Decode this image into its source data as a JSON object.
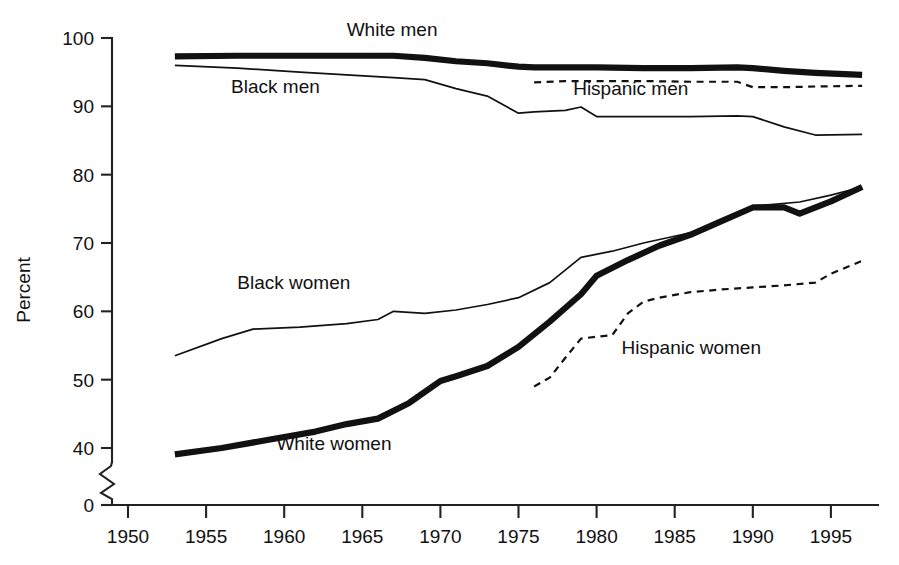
{
  "chart_data": {
    "type": "line",
    "title": "",
    "subtitle": "",
    "xlabel": "",
    "ylabel": "Percent",
    "xlim": [
      1948,
      1998.5
    ],
    "ylim": [
      0,
      100
    ],
    "y_axis_break": {
      "present": true,
      "from": 0,
      "to": 30,
      "note": "zigzag break between 0 and 40 tick"
    },
    "grid": false,
    "legend_position": "inline-labels",
    "xticks": [
      1950,
      1955,
      1960,
      1965,
      1970,
      1975,
      1980,
      1985,
      1990,
      1995
    ],
    "xtick_labels": [
      "1950",
      "1955",
      "1960",
      "1965",
      "1970",
      "1975",
      "1980",
      "1985",
      "1990",
      "1995"
    ],
    "yticks": [
      0,
      40,
      50,
      60,
      70,
      80,
      90,
      100
    ],
    "ytick_labels": [
      "0",
      "40",
      "50",
      "60",
      "70",
      "80",
      "90",
      "100"
    ],
    "series": [
      {
        "name": "White men",
        "style": "solid-thick",
        "label": "White men",
        "label_x": 1964.0,
        "label_y": 100.3,
        "x": [
          1953,
          1957,
          1961,
          1964,
          1967,
          1969,
          1971,
          1973,
          1975,
          1976,
          1978,
          1980,
          1983,
          1986,
          1989,
          1990,
          1992,
          1994,
          1997
        ],
        "y": [
          97.3,
          97.4,
          97.4,
          97.4,
          97.4,
          97.1,
          96.6,
          96.3,
          95.8,
          95.7,
          95.7,
          95.7,
          95.6,
          95.6,
          95.7,
          95.6,
          95.2,
          94.9,
          94.6
        ]
      },
      {
        "name": "Black men",
        "style": "solid-thin",
        "label": "Black men",
        "label_x": 1956.6,
        "label_y": 92.0,
        "x": [
          1953,
          1957,
          1961,
          1964,
          1967,
          1969,
          1971,
          1973,
          1975,
          1976,
          1978,
          1979,
          1980,
          1983,
          1986,
          1989,
          1990,
          1992,
          1994,
          1997
        ],
        "y": [
          96.0,
          95.6,
          95.0,
          94.6,
          94.2,
          93.9,
          92.6,
          91.5,
          89.0,
          89.2,
          89.4,
          89.9,
          88.5,
          88.5,
          88.5,
          88.6,
          88.5,
          87.0,
          85.8,
          85.9
        ]
      },
      {
        "name": "Hispanic men",
        "style": "dashed",
        "label": "Hispanic men",
        "label_x": 1978.5,
        "label_y": 91.6,
        "x": [
          1976,
          1978,
          1980,
          1983,
          1986,
          1989,
          1990,
          1992,
          1994,
          1997
        ],
        "y": [
          93.5,
          93.7,
          93.7,
          93.7,
          93.6,
          93.6,
          92.8,
          92.8,
          92.9,
          93.0
        ]
      },
      {
        "name": "Black women",
        "style": "solid-thin",
        "label": "Black women",
        "label_x": 1957.0,
        "label_y": 63.3,
        "x": [
          1953,
          1956,
          1958,
          1961,
          1964,
          1966,
          1967,
          1969,
          1971,
          1973,
          1975,
          1977,
          1979,
          1981,
          1983,
          1986,
          1988,
          1990,
          1993,
          1995,
          1997
        ],
        "y": [
          53.5,
          56.0,
          57.4,
          57.7,
          58.2,
          58.8,
          60.0,
          59.7,
          60.2,
          61.0,
          62.0,
          64.2,
          67.9,
          68.8,
          70.0,
          71.5,
          73.0,
          75.4,
          76.0,
          77.0,
          78.2
        ]
      },
      {
        "name": "White women",
        "style": "solid-thick",
        "label": "White women",
        "label_x": 1959.5,
        "label_y": 38.4,
        "x": [
          1953,
          1956,
          1959,
          1962,
          1964,
          1966,
          1968,
          1970,
          1971,
          1973,
          1975,
          1977,
          1979,
          1980,
          1982,
          1984,
          1986,
          1988,
          1990,
          1992,
          1993,
          1995,
          1997
        ],
        "y": [
          35.5,
          40.0,
          41.2,
          42.4,
          43.5,
          44.3,
          46.6,
          49.8,
          50.5,
          52.0,
          54.8,
          58.5,
          62.5,
          65.2,
          67.5,
          69.6,
          71.2,
          73.2,
          75.2,
          75.2,
          74.3,
          76.1,
          78.2
        ]
      },
      {
        "name": "Hispanic women",
        "style": "dashed",
        "label": "Hispanic women",
        "label_x": 1981.6,
        "label_y": 53.8,
        "x": [
          1976,
          1977,
          1978,
          1979,
          1980,
          1981,
          1982,
          1983,
          1984,
          1986,
          1988,
          1990,
          1992,
          1994,
          1995,
          1997
        ],
        "y": [
          49.0,
          50.3,
          53.2,
          56.0,
          56.3,
          56.5,
          59.7,
          61.4,
          62.0,
          62.8,
          63.2,
          63.5,
          63.8,
          64.2,
          65.5,
          67.4
        ]
      }
    ]
  },
  "axes": {
    "y_title": "Percent"
  }
}
